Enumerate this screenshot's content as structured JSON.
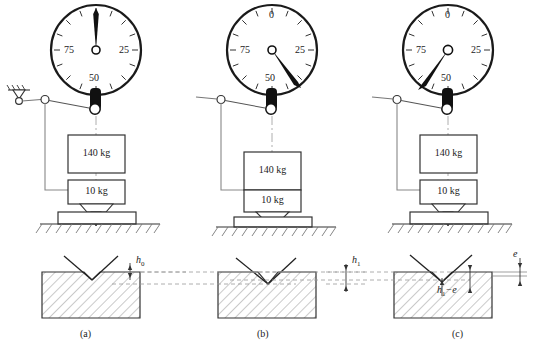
{
  "figure": {
    "panels": [
      {
        "id": "a",
        "caption": "(a)",
        "stage": "minor load applied",
        "gauge": {
          "labels": {
            "top": "0",
            "right": "25",
            "bottom": "50",
            "left": "75"
          },
          "needle_value": 0,
          "needle_angle_deg": 0
        },
        "weights": [
          {
            "label": "140 kg",
            "engaged": false
          },
          {
            "label": "10 kg",
            "engaged": true
          }
        ],
        "depth_label": "h",
        "depth_sub": "0"
      },
      {
        "id": "b",
        "caption": "(b)",
        "stage": "major load applied",
        "gauge": {
          "labels": {
            "top": "0",
            "right": "25",
            "bottom": "50",
            "left": "75"
          },
          "needle_value": 38,
          "needle_angle_deg": 137
        },
        "weights": [
          {
            "label": "140 kg",
            "engaged": true
          },
          {
            "label": "10 kg",
            "engaged": true
          }
        ],
        "depth_label": "h",
        "depth_sub": "1"
      },
      {
        "id": "c",
        "caption": "(c)",
        "stage": "major load removed, elastic recovery",
        "gauge": {
          "labels": {
            "top": "0",
            "right": "25",
            "bottom": "50",
            "left": "75"
          },
          "needle_value": 62,
          "needle_angle_deg": 223
        },
        "weights": [
          {
            "label": "140 kg",
            "engaged": false
          },
          {
            "label": "10 kg",
            "engaged": true
          }
        ],
        "recovery_label": "e",
        "residual_label": "h",
        "residual_sub": "1",
        "residual_tail": "−e"
      }
    ],
    "colors": {
      "ink": "#1a1a1a",
      "line": "#555555",
      "hatch": "#777777",
      "dash": "#999999",
      "needle": "#111111"
    }
  }
}
